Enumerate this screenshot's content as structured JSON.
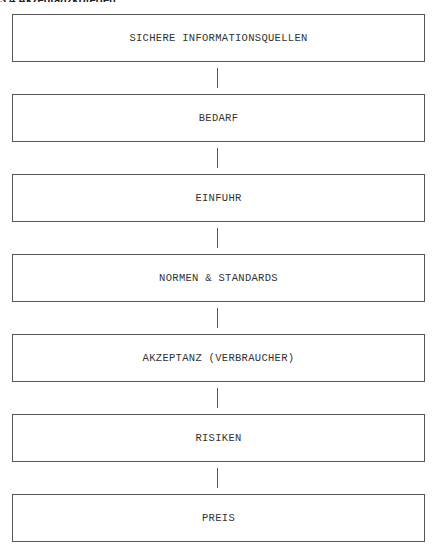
{
  "header": {
    "partial_title": "3.4 Akzeptanzkriterien"
  },
  "diagram": {
    "type": "vertical-flow",
    "boxes": [
      {
        "label": "SICHERE INFORMATIONSQUELLEN"
      },
      {
        "label": "BEDARF"
      },
      {
        "label": "EINFUHR"
      },
      {
        "label": "NORMEN & STANDARDS"
      },
      {
        "label": "AKZEPTANZ (VERBRAUCHER)"
      },
      {
        "label": "RISIKEN"
      },
      {
        "label": "PREIS"
      }
    ]
  }
}
